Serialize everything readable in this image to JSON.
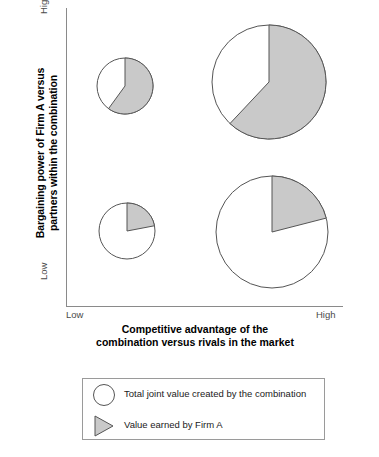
{
  "chart_data": {
    "type": "pie",
    "title": "",
    "xlabel": "Competitive advantage of the combination versus rivals in the market",
    "ylabel": "Bargaining power of Firm A versus partners within the combination",
    "xlabel_line1": "Competitive advantage of the",
    "xlabel_line2": "combination versus rivals in the market",
    "ylabel_line1": "Bargaining power of Firm A versus",
    "ylabel_line2": "partners within the combination",
    "x_ticks": [
      "Low",
      "High"
    ],
    "y_ticks": [
      "Low",
      "High"
    ],
    "xlim": [
      "Low",
      "High"
    ],
    "ylim": [
      "Low",
      "High"
    ],
    "grid": false,
    "legend_position": "below-plot",
    "colors": {
      "shaded": "#c9c9c9",
      "unshaded": "#ffffff",
      "outline": "#555555",
      "axis": "#8a8a8a",
      "tick_text": "#4a4a4a",
      "title_text": "#000000"
    },
    "series": [
      {
        "name": "Total joint value created by the combination",
        "key": "total_value",
        "encoding": "pie-circle-area"
      },
      {
        "name": "Value earned by Firm A",
        "key": "firm_a_share",
        "encoding": "shaded-wedge"
      }
    ],
    "points": [
      {
        "id": "low-advantage-high-power",
        "quadrant": "top-left",
        "x_position": "Low",
        "y_position": "High",
        "total_value_radius": 28,
        "firm_a_share_pct": 60,
        "cx": 125,
        "cy": 86
      },
      {
        "id": "high-advantage-high-power",
        "quadrant": "top-right",
        "x_position": "High",
        "y_position": "High",
        "total_value_radius": 57,
        "firm_a_share_pct": 62,
        "cx": 269,
        "cy": 82
      },
      {
        "id": "low-advantage-low-power",
        "quadrant": "bottom-left",
        "x_position": "Low",
        "y_position": "Low",
        "total_value_radius": 28,
        "firm_a_share_pct": 22,
        "cx": 127,
        "cy": 231
      },
      {
        "id": "high-advantage-low-power",
        "quadrant": "bottom-right",
        "x_position": "High",
        "y_position": "Low",
        "total_value_radius": 56,
        "firm_a_share_pct": 21,
        "cx": 272,
        "cy": 232
      }
    ]
  },
  "legend": {
    "items": [
      {
        "symbol": "white-circle",
        "label": "Total joint value created by the combination"
      },
      {
        "symbol": "gray-wedge",
        "label": "Value earned by Firm A"
      }
    ]
  }
}
